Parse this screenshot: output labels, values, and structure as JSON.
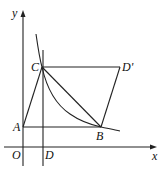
{
  "diagram": {
    "type": "coordinate-geometry",
    "axes": {
      "x_label": "x",
      "y_label": "y",
      "origin_label": "O"
    },
    "points": {
      "A": {
        "label": "A",
        "x": 23,
        "y": 127
      },
      "B": {
        "label": "B",
        "x": 101,
        "y": 127
      },
      "C": {
        "label": "C",
        "x": 42,
        "y": 67
      },
      "D": {
        "label": "D",
        "x": 43,
        "y": 147
      },
      "D_prime": {
        "label": "D'",
        "x": 120,
        "y": 67
      },
      "O": {
        "label": "O",
        "x": 23,
        "y": 147
      }
    },
    "segments": [
      "AC",
      "AB",
      "CB",
      "CD'",
      "D'B"
    ],
    "vertical_line": "through D and C (x = const)",
    "curve": "hyperbola branch passing through C and B"
  }
}
